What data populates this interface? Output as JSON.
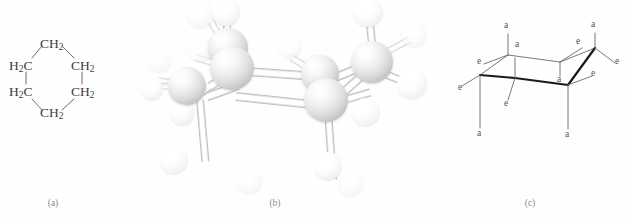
{
  "figure": {
    "background_color": "#ffffff",
    "panels": [
      {
        "id": "a",
        "caption": "(a)",
        "type": "structural-formula",
        "description": "Flat hexagonal structural formula of cyclohexane"
      },
      {
        "id": "b",
        "caption": "(b)",
        "type": "ball-and-stick-model",
        "description": "Three dimensional ball and stick model of cyclohexane in the chair conformation"
      },
      {
        "id": "c",
        "caption": "(c)",
        "type": "chair-conformation-diagram",
        "description": "Chair conformation line drawing with axial and equatorial bond labels"
      }
    ]
  },
  "panel_a": {
    "caption": "(a)",
    "molecule": "cyclohexane",
    "vertex_labels": [
      {
        "id": "top",
        "text": "CH",
        "subscript": "2",
        "x": 47,
        "y": 45
      },
      {
        "id": "upper-right",
        "text": "CH",
        "subscript": "2",
        "x": 75,
        "y": 66
      },
      {
        "id": "lower-right",
        "text": "CH",
        "subscript": "2",
        "x": 75,
        "y": 92
      },
      {
        "id": "bottom",
        "text": "CH",
        "subscript": "2",
        "x": 47,
        "y": 112
      },
      {
        "id": "lower-left",
        "text": "H",
        "subscript": "2",
        "suffix": "C",
        "x": 13,
        "y": 92
      },
      {
        "id": "upper-left",
        "text": "H",
        "subscript": "2",
        "suffix": "C",
        "x": 13,
        "y": 66
      }
    ],
    "bond_color": "#6b6b6b",
    "bond_count": 6
  },
  "panel_b": {
    "caption": "(b)",
    "molecule": "cyclohexane",
    "conformation": "chair",
    "carbon_atom_count": 6,
    "hydrogen_atom_count": 12,
    "carbon_color": "#dcdcdc",
    "hydrogen_color": "#f5f5f5",
    "bond_color": "#ffffff",
    "bond_outline_color": "#bdbdbd",
    "carbons": [
      {
        "id": "C1",
        "x": 66,
        "y": 86,
        "r": 19,
        "z": 2
      },
      {
        "id": "C2",
        "x": 92,
        "y": 68,
        "r": 22,
        "z": 3
      },
      {
        "id": "C3",
        "x": 88,
        "y": 48,
        "r": 20,
        "z": 1
      },
      {
        "id": "C4",
        "x": 180,
        "y": 74,
        "r": 19,
        "z": 2
      },
      {
        "id": "C5",
        "x": 186,
        "y": 100,
        "r": 22,
        "z": 3
      },
      {
        "id": "C6",
        "x": 232,
        "y": 62,
        "r": 21,
        "z": 1
      }
    ],
    "hydrogens": [
      {
        "id": "H1",
        "x": 86,
        "y": 10,
        "r": 14,
        "back": false
      },
      {
        "id": "H2",
        "x": 60,
        "y": 14,
        "r": 13,
        "back": true
      },
      {
        "id": "H3",
        "x": 20,
        "y": 60,
        "r": 12,
        "back": true
      },
      {
        "id": "H4",
        "x": 42,
        "y": 112,
        "r": 13,
        "back": false
      },
      {
        "id": "H5",
        "x": 34,
        "y": 160,
        "r": 14,
        "back": false
      },
      {
        "id": "H6",
        "x": 60,
        "y": 50,
        "r": 12,
        "back": true
      },
      {
        "id": "H7",
        "x": 150,
        "y": 46,
        "r": 12,
        "back": true
      },
      {
        "id": "H8",
        "x": 226,
        "y": 112,
        "r": 14,
        "back": false
      },
      {
        "id": "H9",
        "x": 188,
        "y": 166,
        "r": 14,
        "back": false
      },
      {
        "id": "H10",
        "x": 228,
        "y": 12,
        "r": 15,
        "back": false
      },
      {
        "id": "H11",
        "x": 272,
        "y": 84,
        "r": 15,
        "back": false
      },
      {
        "id": "H12",
        "x": 274,
        "y": 34,
        "r": 13,
        "back": true
      }
    ]
  },
  "panel_c": {
    "caption": "(c)",
    "molecule": "cyclohexane",
    "conformation": "chair",
    "axial_label": "a",
    "equatorial_label": "e",
    "label_color": "#555555",
    "ring_line_color": "#555555",
    "bold_line_color": "#1a1a1a",
    "ring_vertices": [
      {
        "id": "V1",
        "x": 20,
        "y": 75
      },
      {
        "id": "V2",
        "x": 48,
        "y": 55
      },
      {
        "id": "V3",
        "x": 100,
        "y": 62
      },
      {
        "id": "V4",
        "x": 135,
        "y": 48
      },
      {
        "id": "V5",
        "x": 108,
        "y": 85
      },
      {
        "id": "V6",
        "x": 55,
        "y": 78
      }
    ],
    "substituent_labels": [
      {
        "text": "a",
        "position": "up",
        "x": 46,
        "y": 28
      },
      {
        "text": "a",
        "position": "up",
        "x": 133,
        "y": 27
      },
      {
        "text": "a",
        "position": "up",
        "x": 57,
        "y": 47
      },
      {
        "text": "a",
        "position": "down",
        "x": 99,
        "y": 81
      },
      {
        "text": "a",
        "position": "down",
        "x": 20,
        "y": 134
      },
      {
        "text": "a",
        "position": "down",
        "x": 106,
        "y": 135
      },
      {
        "text": "e",
        "position": "left",
        "x": 8,
        "y": 60
      },
      {
        "text": "e",
        "position": "left",
        "x": 116,
        "y": 43
      },
      {
        "text": "e",
        "position": "right",
        "x": 158,
        "y": 63
      },
      {
        "text": "e",
        "position": "right",
        "x": 131,
        "y": 78
      },
      {
        "text": "e",
        "position": "down",
        "x": 44,
        "y": 103
      },
      {
        "text": "e",
        "position": "left",
        "x": 1,
        "y": 88
      }
    ]
  }
}
